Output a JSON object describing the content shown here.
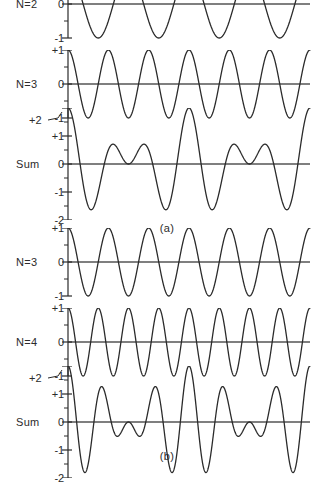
{
  "figure": {
    "background_color": "#ffffff",
    "curve_color": "#2b2b2b",
    "axis_color": "#555555",
    "text_color": "#2b2b2b"
  },
  "groups": [
    {
      "id": "a",
      "caption": "(a)",
      "panels": [
        {
          "id": "a-n2",
          "row_label": "N=2",
          "tick_labels": [
            "+1",
            "0",
            "-1"
          ],
          "overflow_label": null
        },
        {
          "id": "a-n3",
          "row_label": "N=3",
          "tick_labels": [
            "+1",
            "0",
            "-1"
          ],
          "overflow_label": null
        },
        {
          "id": "a-sum",
          "row_label": "Sum",
          "tick_labels": [
            "+1",
            "0",
            "-1",
            "-2"
          ],
          "overflow_label": "+2"
        }
      ]
    },
    {
      "id": "b",
      "caption": "(b)",
      "panels": [
        {
          "id": "b-n3",
          "row_label": "N=3",
          "tick_labels": [
            "+1",
            "0",
            "-1"
          ],
          "overflow_label": null
        },
        {
          "id": "b-n4",
          "row_label": "N=4",
          "tick_labels": [
            "+1",
            "0",
            "-1"
          ],
          "overflow_label": null
        },
        {
          "id": "b-sum",
          "row_label": "Sum",
          "tick_labels": [
            "+1",
            "0",
            "-1",
            "-2"
          ],
          "overflow_label": "+2"
        }
      ]
    }
  ],
  "chart_data": [
    {
      "type": "line",
      "id": "a-n2",
      "title": "N=2",
      "xlabel": "",
      "ylabel": "",
      "ylim": [
        -1,
        1
      ],
      "xlim": [
        0,
        1
      ],
      "grid": false,
      "legend": "none",
      "ytick_values": [
        1,
        0,
        -1
      ],
      "ytick_labels": [
        "+1",
        "0",
        "-1"
      ],
      "series": [
        {
          "name": "N=2",
          "form": "cos(2*pi*4*x)",
          "cycles": 4,
          "amplitude": 1,
          "phase_deg": 0
        }
      ]
    },
    {
      "type": "line",
      "id": "a-n3",
      "title": "N=3",
      "xlabel": "",
      "ylabel": "",
      "ylim": [
        -1,
        1
      ],
      "xlim": [
        0,
        1
      ],
      "grid": false,
      "legend": "none",
      "ytick_values": [
        1,
        0,
        -1
      ],
      "ytick_labels": [
        "+1",
        "0",
        "-1"
      ],
      "series": [
        {
          "name": "N=3",
          "form": "cos(2*pi*6*x)",
          "cycles": 6,
          "amplitude": 1,
          "phase_deg": 0
        }
      ]
    },
    {
      "type": "line",
      "id": "a-sum",
      "title": "Sum",
      "xlabel": "",
      "ylabel": "",
      "ylim": [
        -2,
        2
      ],
      "xlim": [
        0,
        1
      ],
      "grid": false,
      "legend": "none",
      "ytick_values": [
        2,
        1,
        0,
        -1,
        -2
      ],
      "ytick_labels": [
        "+2",
        "+1",
        "0",
        "-1",
        "-2"
      ],
      "series": [
        {
          "name": "Sum",
          "form": "cos(2*pi*4*x) + cos(2*pi*6*x)",
          "cycles": 0,
          "amplitude": 2,
          "phase_deg": 0,
          "beats": 2
        }
      ]
    },
    {
      "type": "line",
      "id": "b-n3",
      "title": "N=3",
      "xlabel": "",
      "ylabel": "",
      "ylim": [
        -1,
        1
      ],
      "xlim": [
        0,
        1
      ],
      "grid": false,
      "legend": "none",
      "ytick_values": [
        1,
        0,
        -1
      ],
      "ytick_labels": [
        "+1",
        "0",
        "-1"
      ],
      "series": [
        {
          "name": "N=3",
          "form": "cos(2*pi*6*x)",
          "cycles": 6,
          "amplitude": 1,
          "phase_deg": 0
        }
      ]
    },
    {
      "type": "line",
      "id": "b-n4",
      "title": "N=4",
      "xlabel": "",
      "ylabel": "",
      "ylim": [
        -1,
        1
      ],
      "xlim": [
        0,
        1
      ],
      "grid": false,
      "legend": "none",
      "ytick_values": [
        1,
        0,
        -1
      ],
      "ytick_labels": [
        "+1",
        "0",
        "-1"
      ],
      "series": [
        {
          "name": "N=4",
          "form": "cos(2*pi*8*x)",
          "cycles": 8,
          "amplitude": 1,
          "phase_deg": 0
        }
      ]
    },
    {
      "type": "line",
      "id": "b-sum",
      "title": "Sum",
      "xlabel": "",
      "ylabel": "",
      "ylim": [
        -2,
        2
      ],
      "xlim": [
        0,
        1
      ],
      "grid": false,
      "legend": "none",
      "ytick_values": [
        2,
        1,
        0,
        -1,
        -2
      ],
      "ytick_labels": [
        "+2",
        "+1",
        "0",
        "-1",
        "-2"
      ],
      "series": [
        {
          "name": "Sum",
          "form": "cos(2*pi*6*x) + cos(2*pi*8*x)",
          "cycles": 0,
          "amplitude": 2,
          "phase_deg": 0,
          "beats": 2
        }
      ]
    }
  ]
}
